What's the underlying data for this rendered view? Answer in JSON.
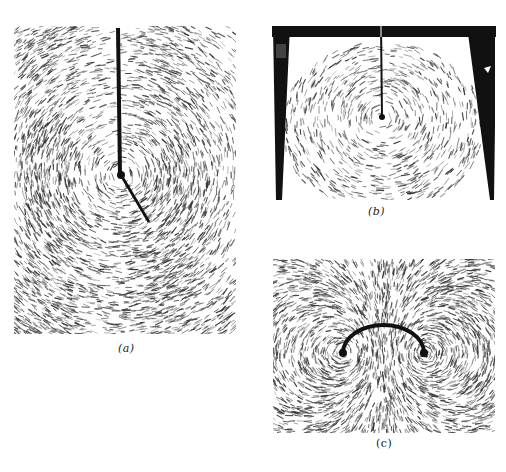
{
  "figure": {
    "panels": [
      {
        "id": "a",
        "caption": "(a)",
        "description": "Iron filings forming concentric circles around a straight vertical wire, with a diagonal wire leaving from the junction"
      },
      {
        "id": "b",
        "caption": "(b)",
        "description": "Iron filings around a wire suspended from a dark trapezoidal frame"
      },
      {
        "id": "c",
        "caption": "(c)",
        "description": "Iron filings pattern around a semicircular wire loop"
      }
    ],
    "colors": {
      "background": "#ffffff",
      "ink": "#111111",
      "filings": "#333333"
    }
  }
}
